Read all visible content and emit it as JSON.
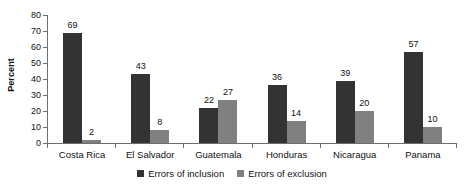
{
  "chart_data": {
    "type": "bar",
    "title": "",
    "xlabel": "",
    "ylabel": "Percent",
    "ylim": [
      0,
      80
    ],
    "yticks": [
      0,
      10,
      20,
      30,
      40,
      50,
      60,
      70,
      80
    ],
    "grid": false,
    "legend_position": "bottom-center",
    "categories": [
      "Costa Rica",
      "El Salvador",
      "Guatemala",
      "Honduras",
      "Nicaragua",
      "Panama"
    ],
    "series": [
      {
        "name": "Errors of inclusion",
        "color": "#333333",
        "values": [
          69,
          43,
          22,
          36,
          39,
          57
        ]
      },
      {
        "name": "Errors of exclusion",
        "color": "#808080",
        "values": [
          2,
          8,
          27,
          14,
          20,
          10
        ]
      }
    ]
  },
  "axis": {
    "y_title": "Percent",
    "y_tick_labels": [
      "80",
      "70",
      "60",
      "50",
      "40",
      "30",
      "20",
      "10",
      "0"
    ]
  },
  "legend": {
    "items": [
      {
        "label": "Errors of inclusion",
        "color": "#333333"
      },
      {
        "label": "Errors of exclusion",
        "color": "#808080"
      }
    ]
  }
}
